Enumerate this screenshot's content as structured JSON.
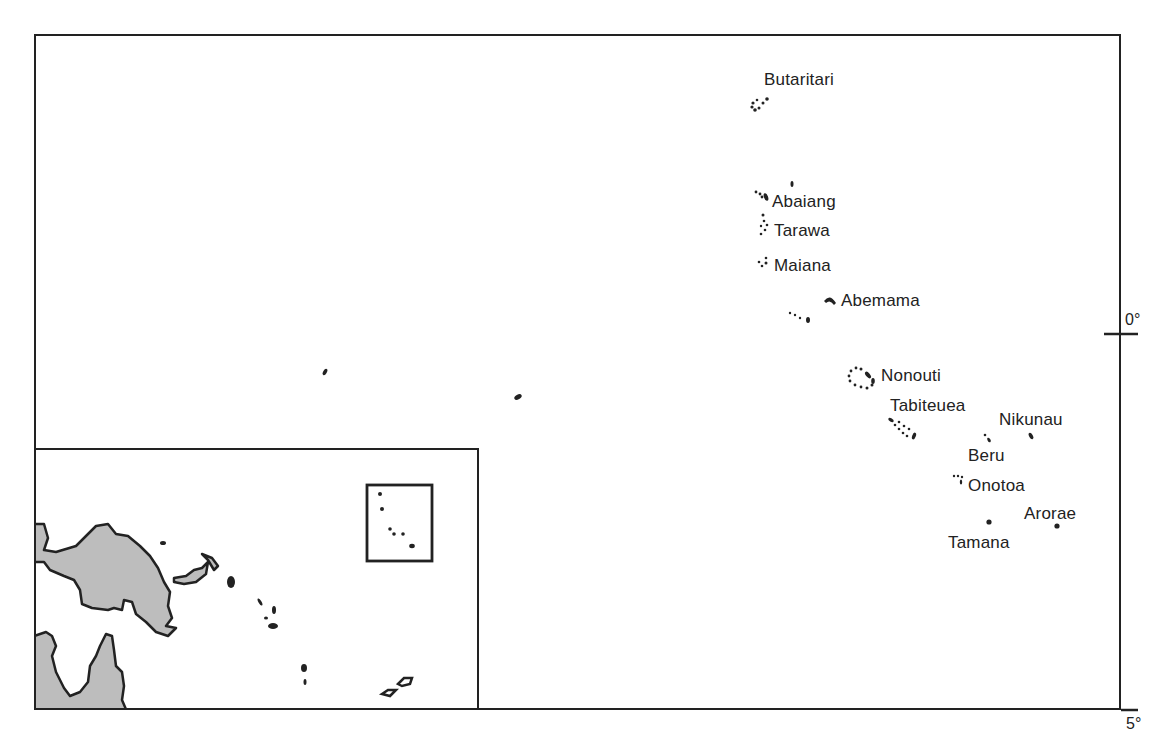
{
  "map": {
    "title": "",
    "colors": {
      "ink": "#222222",
      "land": "#bdbdbd",
      "background": "#ffffff"
    },
    "islands": [
      {
        "name": "Butaritari",
        "label": "Butaritari"
      },
      {
        "name": "Abaiang",
        "label": "Abaiang"
      },
      {
        "name": "Tarawa",
        "label": "Tarawa"
      },
      {
        "name": "Maiana",
        "label": "Maiana"
      },
      {
        "name": "Abemama",
        "label": "Abemama"
      },
      {
        "name": "Nonouti",
        "label": "Nonouti"
      },
      {
        "name": "Tabiteuea",
        "label": "Tabiteuea"
      },
      {
        "name": "Nikunau",
        "label": "Nikunau"
      },
      {
        "name": "Beru",
        "label": "Beru"
      },
      {
        "name": "Onotoa",
        "label": "Onotoa"
      },
      {
        "name": "Arorae",
        "label": "Arorae"
      },
      {
        "name": "Tamana",
        "label": "Tamana"
      }
    ],
    "latitude_ticks": [
      {
        "label": "0°"
      },
      {
        "label": "5°"
      }
    ],
    "inset": {
      "description": "Locator map showing New Guinea, Solomon Islands and Kiribati (Gilbert Islands) highlighted by rectangle"
    }
  }
}
